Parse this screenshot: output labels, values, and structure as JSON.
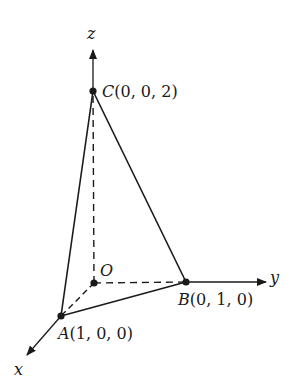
{
  "diagram": {
    "type": "3d-tetrahedron-axes",
    "axes": {
      "x": {
        "label": "x"
      },
      "y": {
        "label": "y"
      },
      "z": {
        "label": "z"
      }
    },
    "points": {
      "O": {
        "name": "O",
        "coords": ""
      },
      "A": {
        "name": "A",
        "coords": "(1, 0, 0)"
      },
      "B": {
        "name": "B",
        "coords": "(0, 1, 0)"
      },
      "C": {
        "name": "C",
        "coords": "(0, 0, 2)"
      }
    },
    "edges": {
      "solid": [
        "CA",
        "CB",
        "AB"
      ],
      "dashed": [
        "OA",
        "OB",
        "OC"
      ]
    },
    "colors": {
      "ink": "#1a1a1a",
      "background": "#ffffff"
    }
  }
}
